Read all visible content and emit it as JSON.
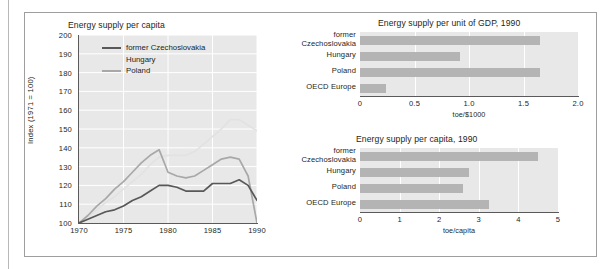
{
  "figure": {
    "series_names": [
      "former Czechoslovakia",
      "Hungary",
      "Poland"
    ],
    "colors": {
      "czechoslovakia": "#58585a",
      "hungary": "#e2e2e2",
      "poland": "#a8a8a8",
      "bar": "#b4b4b4",
      "plot_background": "#e8e8e8",
      "gridline": "#ffffff",
      "axis": "#5a5a5a",
      "text": "#231f20"
    }
  },
  "chart_data": [
    {
      "id": "line",
      "type": "line",
      "title": "Energy supply per capita",
      "xlabel": "",
      "ylabel": "Index (1971 = 100)",
      "xlim": [
        1970,
        1990
      ],
      "ylim": [
        100,
        200
      ],
      "xticks": [
        1970,
        1975,
        1980,
        1985,
        1990
      ],
      "yticks": [
        100,
        110,
        120,
        130,
        140,
        150,
        160,
        170,
        180,
        190,
        200
      ],
      "grid": true,
      "legend_position": "top-left",
      "x": [
        1970,
        1971,
        1972,
        1973,
        1974,
        1975,
        1976,
        1977,
        1978,
        1979,
        1980,
        1981,
        1982,
        1983,
        1984,
        1985,
        1986,
        1987,
        1988,
        1989,
        1990
      ],
      "series": [
        {
          "name": "former Czechoslovakia",
          "color": "#58585a",
          "values": [
            100,
            102,
            104,
            106,
            107,
            109,
            112,
            114,
            117,
            120,
            120,
            119,
            117,
            117,
            117,
            121,
            121,
            121,
            123,
            120,
            112
          ]
        },
        {
          "name": "Hungary",
          "color": "#e2e2e2",
          "values": [
            100,
            103,
            107,
            111,
            114,
            118,
            122,
            126,
            131,
            135,
            136,
            136,
            136,
            138,
            142,
            146,
            150,
            155,
            155,
            152,
            149
          ]
        },
        {
          "name": "Poland",
          "color": "#a8a8a8",
          "values": [
            100,
            104,
            109,
            113,
            118,
            122,
            127,
            132,
            136,
            139,
            127,
            125,
            124,
            125,
            128,
            131,
            134,
            135,
            134,
            125,
            100
          ]
        }
      ]
    },
    {
      "id": "gdp",
      "type": "bar",
      "orientation": "horizontal",
      "title": "Energy supply per unit of GDP, 1990",
      "xlabel": "toe/$1000",
      "ylabel": "",
      "xlim": [
        0,
        2.0
      ],
      "xticks": [
        "0",
        "0.5",
        "1.0",
        "1.5",
        "2.0"
      ],
      "xtick_values": [
        0,
        0.5,
        1.0,
        1.5,
        2.0
      ],
      "categories": [
        "former Czechoslovakia",
        "Hungary",
        "Poland",
        "OECD Europe"
      ],
      "values": [
        1.65,
        0.92,
        1.65,
        0.24
      ],
      "grid": true
    },
    {
      "id": "capita",
      "type": "bar",
      "orientation": "horizontal",
      "title": "Energy supply per capita, 1990",
      "xlabel": "toe/capita",
      "ylabel": "",
      "xlim": [
        0,
        5
      ],
      "xticks": [
        "0",
        "1",
        "2",
        "3",
        "4",
        "5"
      ],
      "xtick_values": [
        0,
        1,
        2,
        3,
        4,
        5
      ],
      "categories": [
        "former Czechoslovakia",
        "Hungary",
        "Poland",
        "OECD Europe"
      ],
      "values": [
        4.5,
        2.75,
        2.6,
        3.25
      ],
      "grid": true
    }
  ]
}
